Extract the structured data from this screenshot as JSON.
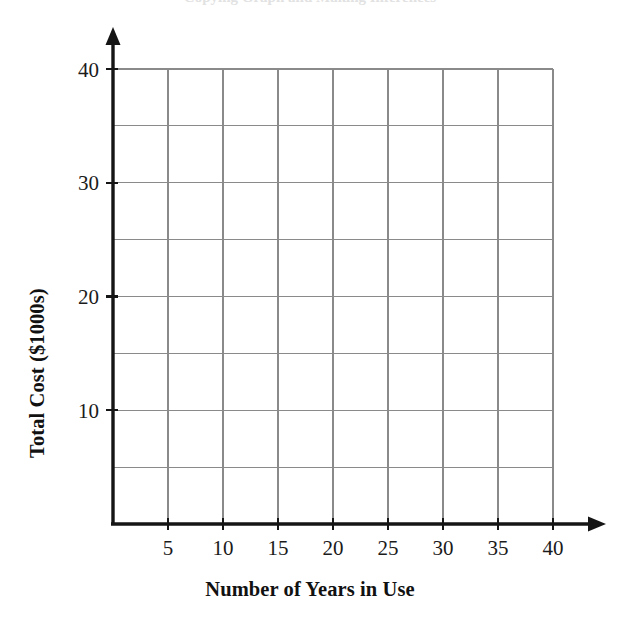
{
  "figure": {
    "cropped_title_fragment": "Copying Graph and Making Inferences",
    "background_color": "#ffffff",
    "axis_color": "#151515",
    "gridline_color": "#8a8a8a"
  },
  "chart_data": {
    "type": "scatter",
    "title": "",
    "xlabel": "Number of Years in Use",
    "ylabel": "Total Cost ($1000s)",
    "xlim": [
      0,
      40
    ],
    "ylim": [
      0,
      40
    ],
    "xticks": [
      5,
      10,
      15,
      20,
      25,
      30,
      35,
      40
    ],
    "yticks": [
      10,
      20,
      30,
      40
    ],
    "xtick_labels": [
      "5",
      "10",
      "15",
      "20",
      "25",
      "30",
      "35",
      "40"
    ],
    "ytick_labels": [
      "10",
      "20",
      "30",
      "40"
    ],
    "x_gridlines": [
      5,
      10,
      15,
      20,
      25,
      30,
      35,
      40
    ],
    "y_gridlines": [
      5,
      10,
      15,
      20,
      25,
      30,
      35,
      40
    ],
    "grid": true,
    "legend": false,
    "legend_position": "none",
    "series": [
      {
        "name": "Total Cost",
        "x": [],
        "y": []
      }
    ],
    "annotations": []
  },
  "icons": {
    "x_axis_arrow": "arrow-right-icon",
    "y_axis_arrow": "arrow-up-icon"
  }
}
